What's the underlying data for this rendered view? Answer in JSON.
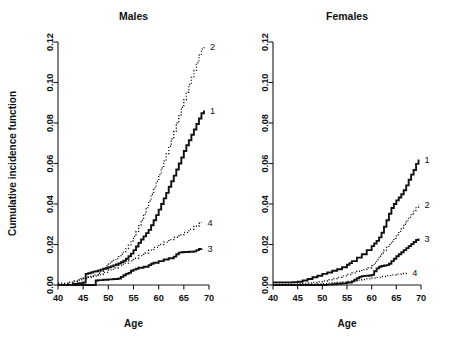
{
  "figure": {
    "width": 456,
    "height": 347,
    "background": "#ffffff",
    "foreground": "#111111"
  },
  "chart_data": [
    {
      "type": "line",
      "title": "Males",
      "xlabel": "Age",
      "ylabel": "Cumulative incidence function",
      "xlim": [
        40,
        70
      ],
      "ylim": [
        0.0,
        0.12
      ],
      "xticks": [
        40,
        45,
        50,
        55,
        60,
        65,
        70
      ],
      "xticklabels": [
        "40",
        "45",
        "50",
        "55",
        "60",
        "65",
        "70"
      ],
      "yticks": [
        0.0,
        0.02,
        0.04,
        0.06,
        0.08,
        0.1,
        0.12
      ],
      "yticklabels": [
        "0.00",
        "0.02",
        "0.04",
        "0.06",
        "0.08",
        "0.10",
        "0.12"
      ],
      "grid": false,
      "legend": "curve-end-labels",
      "series": [
        {
          "name": "1",
          "label": "1",
          "style": "solid-thick",
          "end_label_value": 0.086,
          "x": [
            40,
            42,
            43,
            44,
            45,
            45.5,
            46,
            46.5,
            47,
            47.5,
            48,
            48.5,
            49,
            49.5,
            50,
            50.5,
            51,
            51.5,
            52,
            52.5,
            53,
            53.5,
            54,
            54.5,
            55,
            55.5,
            56,
            56.5,
            57,
            57.5,
            58,
            58.5,
            59,
            59.5,
            60,
            60.5,
            61,
            61.5,
            62,
            62.5,
            63,
            63.5,
            64,
            64.5,
            65,
            65.5,
            66,
            66.5,
            67,
            67.5,
            68,
            68.5,
            69
          ],
          "y": [
            0.0,
            0.0,
            0.0005,
            0.0009,
            0.0012,
            0.0055,
            0.0058,
            0.0062,
            0.0066,
            0.0068,
            0.0072,
            0.0076,
            0.008,
            0.0083,
            0.0088,
            0.0092,
            0.0097,
            0.0101,
            0.0106,
            0.0112,
            0.012,
            0.013,
            0.0142,
            0.0155,
            0.0172,
            0.019,
            0.0208,
            0.0225,
            0.024,
            0.0256,
            0.0272,
            0.0295,
            0.032,
            0.0345,
            0.0372,
            0.04,
            0.0428,
            0.0455,
            0.0485,
            0.0512,
            0.054,
            0.057,
            0.06,
            0.063,
            0.0662,
            0.069,
            0.0715,
            0.0742,
            0.0768,
            0.0795,
            0.0822,
            0.0848,
            0.0862
          ]
        },
        {
          "name": "2",
          "label": "2",
          "style": "dotted",
          "end_label_value": 0.118,
          "x": [
            40,
            42,
            43,
            44,
            44.5,
            45,
            46,
            47,
            48,
            48.5,
            49,
            49.5,
            50,
            50.5,
            51,
            51.5,
            52,
            52.5,
            53,
            53.5,
            54,
            54.5,
            55,
            55.5,
            56,
            56.5,
            57,
            57.5,
            58,
            58.5,
            59,
            59.5,
            60,
            60.5,
            61,
            61.5,
            62,
            62.5,
            63,
            63.5,
            64,
            64.5,
            65,
            65.5,
            66,
            66.5,
            67,
            67.5,
            68,
            68.5,
            69
          ],
          "y": [
            0.0008,
            0.0012,
            0.0018,
            0.0024,
            0.003,
            0.0035,
            0.0042,
            0.005,
            0.0058,
            0.0068,
            0.008,
            0.0095,
            0.0108,
            0.0115,
            0.0122,
            0.013,
            0.014,
            0.0152,
            0.0165,
            0.018,
            0.0198,
            0.0218,
            0.024,
            0.0265,
            0.0292,
            0.032,
            0.035,
            0.0382,
            0.0415,
            0.0448,
            0.048,
            0.0512,
            0.0545,
            0.0578,
            0.0612,
            0.0648,
            0.0685,
            0.0722,
            0.076,
            0.08,
            0.084,
            0.0878,
            0.0915,
            0.0952,
            0.099,
            0.1025,
            0.106,
            0.1098,
            0.1135,
            0.1165,
            0.118
          ]
        },
        {
          "name": "3",
          "label": "3",
          "style": "solid-thick",
          "end_label_value": 0.018,
          "x": [
            40,
            44,
            45,
            46,
            47,
            47.5,
            48,
            49,
            50,
            51,
            52,
            52.5,
            53,
            53.5,
            54,
            54.5,
            55,
            55.5,
            56,
            57,
            58,
            58.5,
            59,
            60,
            61,
            62,
            63,
            63.5,
            64,
            64.5,
            65,
            66,
            67,
            67.5,
            68,
            68.5
          ],
          "y": [
            0.0,
            0.0,
            0.0,
            0.0,
            0.0,
            0.0022,
            0.0024,
            0.0026,
            0.0028,
            0.003,
            0.0032,
            0.004,
            0.0048,
            0.0055,
            0.006,
            0.007,
            0.0076,
            0.008,
            0.0085,
            0.009,
            0.0098,
            0.0105,
            0.011,
            0.0118,
            0.0126,
            0.0132,
            0.014,
            0.0152,
            0.016,
            0.0162,
            0.0163,
            0.0164,
            0.0166,
            0.0172,
            0.0178,
            0.018
          ]
        },
        {
          "name": "4",
          "label": "4",
          "style": "dotted",
          "end_label_value": 0.031,
          "x": [
            40,
            42,
            43,
            44,
            45,
            46,
            47,
            48,
            49,
            50,
            51,
            52,
            53,
            54,
            55,
            56,
            57,
            58,
            59,
            60,
            61,
            62,
            63,
            64,
            65,
            66,
            67,
            68,
            68.5
          ],
          "y": [
            0.0008,
            0.0014,
            0.002,
            0.0026,
            0.0032,
            0.0038,
            0.0044,
            0.0052,
            0.0062,
            0.0075,
            0.0085,
            0.0096,
            0.0108,
            0.012,
            0.0132,
            0.0145,
            0.0158,
            0.0172,
            0.0186,
            0.02,
            0.0212,
            0.0224,
            0.0236,
            0.0248,
            0.026,
            0.0275,
            0.029,
            0.0305,
            0.031
          ]
        }
      ]
    },
    {
      "type": "line",
      "title": "Females",
      "xlabel": "Age",
      "ylabel": "",
      "xlim": [
        40,
        70
      ],
      "ylim": [
        0.0,
        0.12
      ],
      "xticks": [
        40,
        45,
        50,
        55,
        60,
        65,
        70
      ],
      "xticklabels": [
        "40",
        "45",
        "50",
        "55",
        "60",
        "65",
        "70"
      ],
      "yticks": [
        0.0,
        0.02,
        0.04,
        0.06,
        0.08,
        0.1,
        0.12
      ],
      "yticklabels": [
        "0.00",
        "0.02",
        "0.04",
        "0.06",
        "0.08",
        "0.10",
        "0.12"
      ],
      "grid": false,
      "legend": "curve-end-labels",
      "series": [
        {
          "name": "1",
          "label": "1",
          "style": "solid-thick",
          "end_label_value": 0.062,
          "x": [
            40,
            43,
            44,
            45,
            46,
            47,
            48,
            49,
            50,
            51,
            52,
            53,
            54,
            55,
            55.5,
            56,
            57,
            58,
            59,
            60,
            60.5,
            61,
            61.5,
            62,
            62.5,
            63,
            63.5,
            64,
            64.5,
            65,
            65.5,
            66,
            66.5,
            67,
            67.5,
            68,
            68.5,
            69,
            69.5
          ],
          "y": [
            0.0013,
            0.0013,
            0.0014,
            0.0016,
            0.0022,
            0.003,
            0.0038,
            0.0046,
            0.0055,
            0.0062,
            0.007,
            0.0078,
            0.0088,
            0.01,
            0.0108,
            0.0118,
            0.0135,
            0.0152,
            0.0172,
            0.0192,
            0.0205,
            0.0218,
            0.0235,
            0.0258,
            0.0288,
            0.032,
            0.0352,
            0.038,
            0.04,
            0.0418,
            0.0432,
            0.0448,
            0.0468,
            0.0492,
            0.052,
            0.0545,
            0.0568,
            0.0598,
            0.062
          ]
        },
        {
          "name": "2",
          "label": "2",
          "style": "dotted",
          "end_label_value": 0.04,
          "x": [
            40,
            45,
            46,
            47,
            48,
            49,
            50,
            51,
            52,
            53,
            54,
            55,
            56,
            57,
            58,
            59,
            60,
            60.5,
            61,
            61.5,
            62,
            62.5,
            63,
            63.5,
            64,
            64.5,
            65,
            65.5,
            66,
            66.5,
            67,
            67.5,
            68,
            68.5,
            69,
            69.5
          ],
          "y": [
            0.0004,
            0.0006,
            0.0008,
            0.001,
            0.0013,
            0.0016,
            0.002,
            0.0026,
            0.0032,
            0.0038,
            0.0045,
            0.0052,
            0.006,
            0.0068,
            0.0076,
            0.0085,
            0.0095,
            0.0108,
            0.0125,
            0.0142,
            0.0158,
            0.0172,
            0.0186,
            0.02,
            0.0215,
            0.023,
            0.0248,
            0.0265,
            0.0282,
            0.03,
            0.0318,
            0.0335,
            0.0352,
            0.0368,
            0.0385,
            0.0398
          ]
        },
        {
          "name": "3",
          "label": "3",
          "style": "solid-thick",
          "end_label_value": 0.023,
          "x": [
            40,
            48,
            49,
            50,
            51,
            52,
            53,
            54,
            55,
            56,
            56.5,
            57,
            57.5,
            58,
            58.5,
            59,
            59.5,
            60,
            60.5,
            61,
            61.5,
            62,
            62.5,
            63,
            63.5,
            64,
            64.5,
            65,
            65.5,
            66,
            66.5,
            67,
            67.5,
            68,
            68.5,
            69,
            69.5
          ],
          "y": [
            0.0,
            0.0,
            0.0,
            0.0,
            0.0002,
            0.0004,
            0.0006,
            0.0008,
            0.0012,
            0.0018,
            0.0026,
            0.0034,
            0.004,
            0.0044,
            0.0045,
            0.0046,
            0.0047,
            0.005,
            0.0068,
            0.0082,
            0.009,
            0.0094,
            0.0096,
            0.0098,
            0.0105,
            0.0118,
            0.013,
            0.0142,
            0.0152,
            0.0162,
            0.0172,
            0.0182,
            0.0192,
            0.0202,
            0.0212,
            0.0222,
            0.023
          ]
        },
        {
          "name": "4",
          "label": "4",
          "style": "dotted",
          "end_label_value": 0.006,
          "x": [
            40,
            47,
            48,
            49,
            50,
            51,
            52,
            53,
            54,
            55,
            56,
            57,
            58,
            59,
            60,
            61,
            62,
            63,
            64,
            65,
            66,
            67
          ],
          "y": [
            0.0002,
            0.0003,
            0.0004,
            0.0005,
            0.0007,
            0.0009,
            0.0011,
            0.0013,
            0.0015,
            0.0018,
            0.0021,
            0.0024,
            0.0027,
            0.003,
            0.0034,
            0.0038,
            0.0042,
            0.0046,
            0.005,
            0.0054,
            0.0057,
            0.006
          ]
        }
      ]
    }
  ]
}
